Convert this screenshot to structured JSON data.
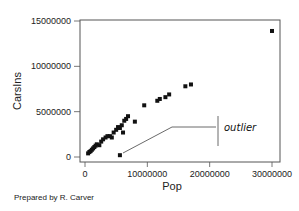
{
  "chart_data": {
    "type": "scatter",
    "title": "",
    "xlabel": "Pop",
    "ylabel": "CarsIns",
    "xlim": [
      -1000000,
      31000000
    ],
    "ylim": [
      -500000,
      15300000
    ],
    "x_ticks": [
      0,
      10000000,
      20000000,
      30000000
    ],
    "x_tick_labels": [
      "0",
      "10000000",
      "20000000",
      "30000000"
    ],
    "y_ticks": [
      0,
      5000000,
      10000000,
      15000000
    ],
    "y_tick_labels": [
      "0",
      "5000000",
      "10000000",
      "15000000"
    ],
    "grid": false,
    "legend": null,
    "series": [
      {
        "name": "States",
        "points": [
          {
            "x": 500000,
            "y": 400000
          },
          {
            "x": 700000,
            "y": 550000
          },
          {
            "x": 900000,
            "y": 650000
          },
          {
            "x": 1100000,
            "y": 800000
          },
          {
            "x": 1300000,
            "y": 950000
          },
          {
            "x": 1500000,
            "y": 1100000
          },
          {
            "x": 1700000,
            "y": 1250000
          },
          {
            "x": 1900000,
            "y": 1400000
          },
          {
            "x": 2300000,
            "y": 1300000
          },
          {
            "x": 2600000,
            "y": 1700000
          },
          {
            "x": 2900000,
            "y": 1950000
          },
          {
            "x": 3300000,
            "y": 2150000
          },
          {
            "x": 3600000,
            "y": 2300000
          },
          {
            "x": 4000000,
            "y": 2300000
          },
          {
            "x": 4300000,
            "y": 2150000
          },
          {
            "x": 4600000,
            "y": 2700000
          },
          {
            "x": 5000000,
            "y": 3000000
          },
          {
            "x": 5300000,
            "y": 3300000
          },
          {
            "x": 5600000,
            "y": 3200000
          },
          {
            "x": 5900000,
            "y": 3500000
          },
          {
            "x": 6100000,
            "y": 2700000
          },
          {
            "x": 6300000,
            "y": 4000000
          },
          {
            "x": 6600000,
            "y": 4200000
          },
          {
            "x": 6900000,
            "y": 4500000
          },
          {
            "x": 8000000,
            "y": 3900000
          },
          {
            "x": 9500000,
            "y": 5700000
          },
          {
            "x": 11600000,
            "y": 6200000
          },
          {
            "x": 12000000,
            "y": 6400000
          },
          {
            "x": 12900000,
            "y": 6600000
          },
          {
            "x": 13500000,
            "y": 6900000
          },
          {
            "x": 16100000,
            "y": 7800000
          },
          {
            "x": 17000000,
            "y": 8000000
          },
          {
            "x": 30000000,
            "y": 13900000
          },
          {
            "x": 5600000,
            "y": 200000,
            "label": "outlier"
          }
        ]
      }
    ],
    "annotations": [
      {
        "text": "outlier",
        "target": {
          "x": 5600000,
          "y": 200000
        }
      }
    ],
    "footer": "Prepared by R. Carver"
  },
  "labels": {
    "xlabel": "Pop",
    "ylabel": "CarsIns",
    "annotation": "outlier",
    "footer": "Prepared by R. Carver"
  }
}
